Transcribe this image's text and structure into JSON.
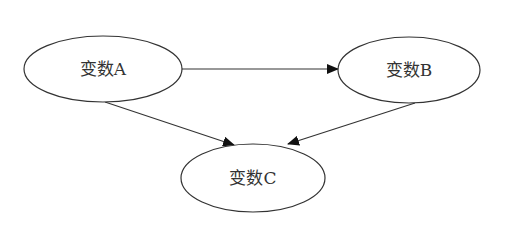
{
  "diagram": {
    "type": "directed-graph",
    "colors": {
      "stroke": "#333333",
      "background": "#ffffff",
      "text": "#333333"
    },
    "nodes": [
      {
        "id": "A",
        "label": "变数A",
        "cx": 103,
        "cy": 69,
        "rx": 79,
        "ry": 33
      },
      {
        "id": "B",
        "label": "变数B",
        "cx": 409,
        "cy": 70,
        "rx": 71,
        "ry": 33
      },
      {
        "id": "C",
        "label": "变数C",
        "cx": 253,
        "cy": 178,
        "rx": 72,
        "ry": 34
      }
    ],
    "edges": [
      {
        "from": "A",
        "to": "B"
      },
      {
        "from": "A",
        "to": "C"
      },
      {
        "from": "B",
        "to": "C"
      }
    ]
  }
}
